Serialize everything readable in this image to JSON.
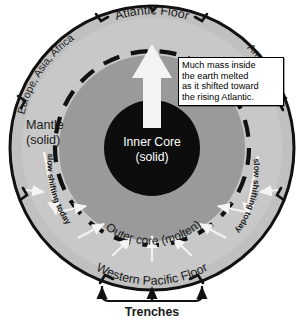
{
  "diagram": {
    "layers": [
      {
        "name": "mantle",
        "label_line1": "Mantle",
        "label_line2": "(solid)",
        "color": "#c8c8c8"
      },
      {
        "name": "outer-core",
        "label": "Outer core (molten)",
        "color": "#9a9a9a"
      },
      {
        "name": "inner-core",
        "label_line1": "Inner Core",
        "label_line2": "(solid)",
        "color": "#0d0d0d"
      }
    ],
    "rim": {
      "top_label": "Atlantic Floor",
      "bottom_label": "Western Pacific Floor",
      "left_label": "Europe, Asia, Africa",
      "right_label": "Americas",
      "color": "#c0c0c0",
      "outline_color": "#111111"
    },
    "motion_labels": {
      "left": "slow shifting today",
      "right": "slow shifting today"
    },
    "trenches": {
      "label": "Trenches"
    },
    "callout": {
      "lines": [
        "Much mass inside",
        "the earth melted",
        "as it shifted toward",
        "the rising Atlantic."
      ]
    },
    "arrows": {
      "main_up": "up-arrow-white",
      "converging": "inward-arrows-white"
    },
    "colors": {
      "background": "#ffffff",
      "mantle": "#c8c8c8",
      "outer_core": "#9a9a9a",
      "inner_core": "#0d0d0d",
      "rim": "#c0c0c0",
      "arrow": "#f2f2f2",
      "text": "#1a1a1a",
      "text_inverse": "#ffffff",
      "dashed_boundary": "#111111"
    }
  }
}
